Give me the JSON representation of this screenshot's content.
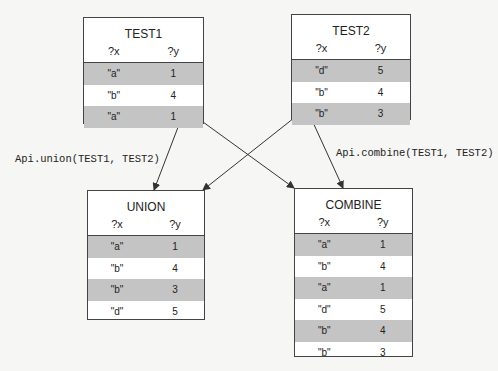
{
  "tables": {
    "test1": {
      "title": "TEST1",
      "columns": [
        "?x",
        "?y"
      ],
      "rows": [
        [
          "\"a\"",
          "1"
        ],
        [
          "\"b\"",
          "4"
        ],
        [
          "\"a\"",
          "1"
        ]
      ]
    },
    "test2": {
      "title": "TEST2",
      "columns": [
        "?x",
        "?y"
      ],
      "rows": [
        [
          "\"d\"",
          "5"
        ],
        [
          "\"b\"",
          "4"
        ],
        [
          "\"b\"",
          "3"
        ]
      ]
    },
    "union": {
      "title": "UNION",
      "columns": [
        "?x",
        "?y"
      ],
      "rows": [
        [
          "\"a\"",
          "1"
        ],
        [
          "\"b\"",
          "4"
        ],
        [
          "\"b\"",
          "3"
        ],
        [
          "\"d\"",
          "5"
        ]
      ]
    },
    "combine": {
      "title": "COMBINE",
      "columns": [
        "?x",
        "?y"
      ],
      "rows": [
        [
          "\"a\"",
          "1"
        ],
        [
          "\"b\"",
          "4"
        ],
        [
          "\"a\"",
          "1"
        ],
        [
          "\"d\"",
          "5"
        ],
        [
          "\"b\"",
          "4"
        ],
        [
          "\"b\"",
          "3"
        ]
      ]
    }
  },
  "labels": {
    "union_call": "Api.union(TEST1, TEST2)",
    "combine_call": "Api.combine(TEST1, TEST2)"
  },
  "colors": {
    "shade": "#c4c4c4",
    "border": "#444444"
  }
}
